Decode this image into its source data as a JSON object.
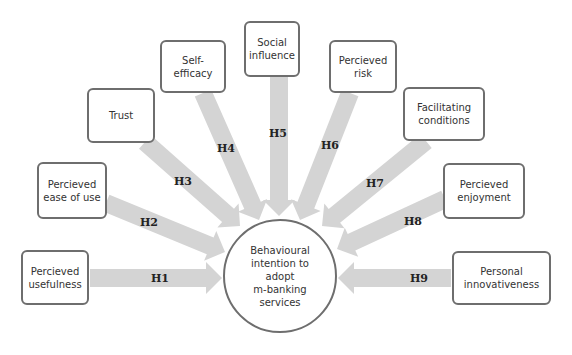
{
  "diagram": {
    "type": "conceptual-model",
    "center": {
      "label": "Behavioural\nintention to\nadopt\nm-banking\nservices",
      "cx": 280,
      "cy": 276,
      "r": 57
    },
    "colors": {
      "arrow": "#d4d4d4",
      "border": "#6e6e6e",
      "text": "#333333",
      "background": "#ffffff"
    },
    "constructs": [
      {
        "id": "pu",
        "label": "Percieved\nusefulness",
        "x": 21,
        "y": 250,
        "w": 68,
        "h": 55,
        "hyp": "H1",
        "hx": 160,
        "hy": 278
      },
      {
        "id": "peou",
        "label": "Percieved\nease of use",
        "x": 37,
        "y": 162,
        "w": 70,
        "h": 57,
        "hyp": "H2",
        "hx": 149,
        "hy": 222
      },
      {
        "id": "tr",
        "label": "Trust",
        "x": 87,
        "y": 88,
        "w": 68,
        "h": 55,
        "hyp": "H3",
        "hx": 183,
        "hy": 181
      },
      {
        "id": "se",
        "label": "Self-efficacy",
        "x": 160,
        "y": 40,
        "w": 66,
        "h": 53,
        "hyp": "H4",
        "hx": 226,
        "hy": 148
      },
      {
        "id": "si",
        "label": "Social\ninfluence",
        "x": 244,
        "y": 21,
        "w": 56,
        "h": 56,
        "hyp": "H5",
        "hx": 278,
        "hy": 133
      },
      {
        "id": "pr",
        "label": "Percieved\nrisk",
        "x": 329,
        "y": 40,
        "w": 68,
        "h": 53,
        "hyp": "H6",
        "hx": 330,
        "hy": 145
      },
      {
        "id": "fc",
        "label": "Facilitating\nconditions",
        "x": 403,
        "y": 87,
        "w": 82,
        "h": 54,
        "hyp": "H7",
        "hx": 375,
        "hy": 183
      },
      {
        "id": "pe",
        "label": "Percieved\nenjoyment",
        "x": 443,
        "y": 163,
        "w": 82,
        "h": 56,
        "hyp": "H8",
        "hx": 413,
        "hy": 221
      },
      {
        "id": "pi",
        "label": "Personal\ninnovativeness",
        "x": 452,
        "y": 251,
        "w": 99,
        "h": 54,
        "hyp": "H9",
        "hx": 419,
        "hy": 278
      }
    ],
    "arrows": [
      {
        "id": "a1",
        "from": [
          90,
          278
        ],
        "to": [
          222,
          278
        ]
      },
      {
        "id": "a2",
        "from": [
          106,
          203
        ],
        "to": [
          225,
          252
        ]
      },
      {
        "id": "a3",
        "from": [
          145,
          142
        ],
        "to": [
          240,
          226
        ]
      },
      {
        "id": "a4",
        "from": [
          203,
          93
        ],
        "to": [
          259,
          220
        ]
      },
      {
        "id": "a5",
        "from": [
          279,
          77
        ],
        "to": [
          279,
          216
        ]
      },
      {
        "id": "a6",
        "from": [
          350,
          93
        ],
        "to": [
          300,
          220
        ]
      },
      {
        "id": "a7",
        "from": [
          426,
          141
        ],
        "to": [
          322,
          226
        ]
      },
      {
        "id": "a8",
        "from": [
          445,
          199
        ],
        "to": [
          337,
          249
        ]
      },
      {
        "id": "a9",
        "from": [
          451,
          278
        ],
        "to": [
          338,
          278
        ]
      }
    ]
  }
}
